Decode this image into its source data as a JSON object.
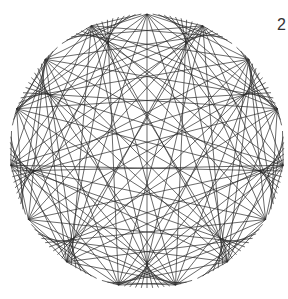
{
  "figure": {
    "label": "2",
    "type": "string-art modular multiplication circle",
    "center": [
      147,
      151
    ],
    "radius": 137,
    "points": 150,
    "multiplier": 10,
    "star_points": 9,
    "line_color": "#2a2a2a",
    "background": "#ffffff"
  }
}
